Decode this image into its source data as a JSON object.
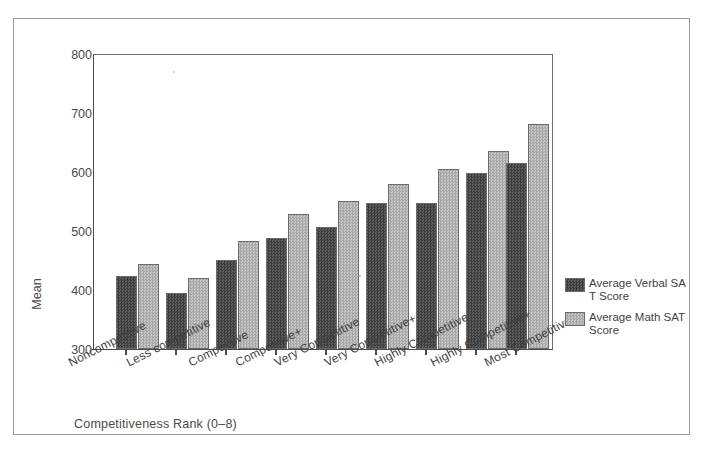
{
  "caption": "",
  "chart_data": {
    "type": "bar",
    "title": "",
    "xlabel": "Competitiveness Rank (0–8)",
    "ylabel": "Mean",
    "ylim": [
      300,
      800
    ],
    "yticks": [
      300,
      400,
      500,
      600,
      700,
      800
    ],
    "ytick_labels": [
      "300",
      "400",
      "500",
      "600",
      "700",
      "800"
    ],
    "grid": false,
    "legend_position": "right",
    "categories": [
      "Noncompetitive",
      "Less competitive",
      "Competitive",
      "Competitive+",
      "Very Competitive",
      "Very Competitive+",
      "Highly Competitive",
      "Highly Competitive+",
      "Most Competitive"
    ],
    "series": [
      {
        "name": "Average Verbal SAT Score",
        "color": "#4f4f4f",
        "values": [
          424,
          396,
          451,
          489,
          508,
          549,
          549,
          600,
          617
        ]
      },
      {
        "name": "Average Math SAT Score",
        "color": "#b3b3b3",
        "values": [
          444,
          421,
          484,
          530,
          552,
          580,
          606,
          637,
          683
        ]
      }
    ]
  },
  "legend": {
    "entries": [
      {
        "label": "Average Verbal SAT Score"
      },
      {
        "label": "Average Math SAT Score"
      }
    ]
  }
}
